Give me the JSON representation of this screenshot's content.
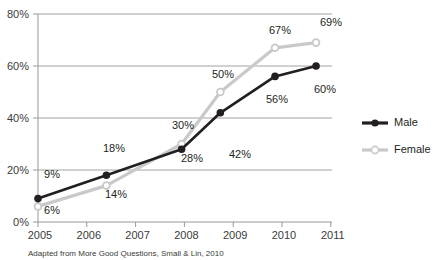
{
  "chart_data": {
    "type": "line",
    "title": "",
    "xlabel": "",
    "ylabel": "",
    "x": [
      2005,
      2006,
      2007,
      2008,
      2009,
      2010,
      2011
    ],
    "categories": [
      "2005",
      "2006",
      "2007",
      "2008",
      "2009",
      "2010",
      "2011"
    ],
    "series": [
      {
        "name": "Male",
        "color": "#231f20",
        "marker": "filled-circle",
        "x": [
          2005,
          2006.5,
          2008.15,
          2009,
          2010.2,
          2011.1
        ],
        "values": [
          9,
          18,
          28,
          42,
          56,
          60
        ],
        "labels": [
          "9%",
          "18%",
          "28%",
          "42%",
          "56%",
          "60%"
        ]
      },
      {
        "name": "Female",
        "color": "#c9c9c9",
        "marker": "open-circle",
        "x": [
          2005,
          2006.5,
          2008.15,
          2009,
          2010.2,
          2011.1
        ],
        "values": [
          6,
          14,
          30,
          50,
          67,
          69
        ],
        "labels": [
          "6%",
          "14%",
          "30%",
          "50%",
          "67%",
          "69%"
        ]
      }
    ],
    "ylim": [
      0,
      80
    ],
    "yticks": [
      0,
      20,
      40,
      60,
      80
    ],
    "ytick_labels": [
      "0%",
      "20%",
      "40%",
      "60%",
      "80%"
    ],
    "xlim": [
      2005,
      2011.45
    ],
    "xticks": [
      2005,
      2006,
      2007,
      2008,
      2009,
      2010,
      2011
    ],
    "grid": "horizontal",
    "legend_position": "right",
    "legend": [
      {
        "label": "Male",
        "color": "#231f20",
        "marker": "filled-circle"
      },
      {
        "label": "Female",
        "color": "#c9c9c9",
        "marker": "open-circle"
      }
    ]
  },
  "caption": {
    "text": "Adapted from More Good Questions, Small & Lin, 2010"
  },
  "axis": {
    "y_labels": [
      "80%",
      "60%",
      "40%",
      "20%",
      "0%"
    ],
    "x_labels": [
      "2005",
      "2006",
      "2007",
      "2008",
      "2009",
      "2010",
      "2011"
    ]
  },
  "data_labels": {
    "male": [
      "9%",
      "18%",
      "28%",
      "42%",
      "56%",
      "60%"
    ],
    "female": [
      "6%",
      "14%",
      "30%",
      "50%",
      "67%",
      "69%"
    ]
  }
}
